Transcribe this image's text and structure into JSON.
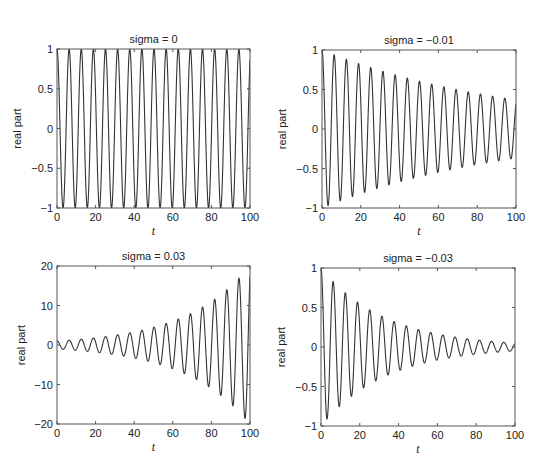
{
  "figure": {
    "layout": "2x2 subplots",
    "line_color": "#333333",
    "axes_color": "#555555"
  },
  "chart_data": [
    {
      "type": "line",
      "title": "sigma = 0",
      "xlabel": "t",
      "ylabel": "real part",
      "sigma": 0,
      "function": "exp(sigma*t)*cos(t)",
      "xlim": [
        0,
        100
      ],
      "ylim": [
        -1,
        1
      ],
      "xticks": [
        "0",
        "20",
        "40",
        "60",
        "80",
        "100"
      ],
      "yticks": [
        "−1",
        "−0.5",
        "0",
        "0.5",
        "1"
      ],
      "ytick_values": [
        -1,
        -0.5,
        0,
        0.5,
        1
      ],
      "x": [
        0,
        10,
        20,
        30,
        40,
        50,
        60,
        70,
        80,
        90,
        100
      ],
      "values": [
        1,
        -0.839,
        0.408,
        0.154,
        -0.667,
        0.965,
        -0.952,
        0.633,
        -0.11,
        -0.448,
        0.862
      ],
      "grid": false
    },
    {
      "type": "line",
      "title": "sigma = −0.01",
      "xlabel": "t",
      "ylabel": "real part",
      "sigma": -0.01,
      "function": "exp(sigma*t)*cos(t)",
      "xlim": [
        0,
        100
      ],
      "ylim": [
        -1,
        1
      ],
      "xticks": [
        "0",
        "20",
        "40",
        "60",
        "80",
        "100"
      ],
      "yticks": [
        "−1",
        "−0.5",
        "0",
        "0.5",
        "1"
      ],
      "ytick_values": [
        -1,
        -0.5,
        0,
        0.5,
        1
      ],
      "x": [
        0,
        10,
        20,
        30,
        40,
        50,
        60,
        70,
        80,
        90,
        100
      ],
      "values": [
        1,
        -0.759,
        0.334,
        0.114,
        -0.447,
        0.585,
        -0.522,
        0.314,
        -0.049,
        -0.182,
        0.317
      ],
      "grid": false
    },
    {
      "type": "line",
      "title": "sigma = 0.03",
      "xlabel": "t",
      "ylabel": "real part",
      "sigma": 0.03,
      "function": "exp(sigma*t)*cos(t)",
      "xlim": [
        0,
        100
      ],
      "ylim": [
        -20,
        20
      ],
      "xticks": [
        "0",
        "20",
        "40",
        "60",
        "80",
        "100"
      ],
      "yticks": [
        "−20",
        "−10",
        "0",
        "10",
        "20"
      ],
      "ytick_values": [
        -20,
        -10,
        0,
        10,
        20
      ],
      "x": [
        0,
        10,
        20,
        30,
        40,
        50,
        60,
        70,
        80,
        90,
        100
      ],
      "values": [
        1,
        -1.133,
        0.743,
        0.379,
        -2.215,
        4.325,
        -5.76,
        5.169,
        -1.212,
        -6.666,
        17.32
      ],
      "grid": false
    },
    {
      "type": "line",
      "title": "sigma = −0.03",
      "xlabel": "t",
      "ylabel": "real part",
      "sigma": -0.03,
      "function": "exp(sigma*t)*cos(t)",
      "xlim": [
        0,
        100
      ],
      "ylim": [
        -1,
        1
      ],
      "xticks": [
        "0",
        "20",
        "40",
        "60",
        "80",
        "100"
      ],
      "yticks": [
        "−1",
        "−0.5",
        "0",
        "0.5",
        "1"
      ],
      "ytick_values": [
        -1,
        -0.5,
        0,
        0.5,
        1
      ],
      "x": [
        0,
        10,
        20,
        30,
        40,
        50,
        60,
        70,
        80,
        90,
        100
      ],
      "values": [
        1,
        -0.622,
        0.224,
        0.063,
        -0.201,
        0.215,
        -0.157,
        0.077,
        -0.01,
        -0.03,
        0.043
      ],
      "grid": false
    }
  ],
  "panels_px": [
    {
      "left": 57,
      "top": 49,
      "right": 250,
      "bottom": 208
    },
    {
      "left": 322,
      "top": 50,
      "right": 516,
      "bottom": 208
    },
    {
      "left": 57,
      "top": 266,
      "right": 250,
      "bottom": 424
    },
    {
      "left": 321,
      "top": 268,
      "right": 515,
      "bottom": 426
    }
  ]
}
